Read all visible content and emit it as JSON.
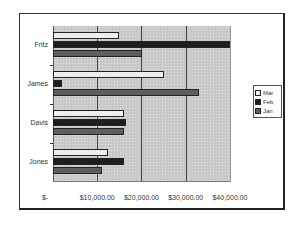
{
  "chart_data": {
    "type": "bar",
    "orientation": "horizontal",
    "title": "",
    "xlabel": "",
    "ylabel": "",
    "categories": [
      "Jones",
      "Davis",
      "James",
      "Fritz"
    ],
    "series": [
      {
        "name": "Jan",
        "values": [
          11000,
          16000,
          33000,
          20000
        ]
      },
      {
        "name": "Feb",
        "values": [
          16000,
          16500,
          2000,
          40000
        ]
      },
      {
        "name": "Mar",
        "values": [
          12500,
          16000,
          25000,
          15000
        ]
      }
    ],
    "xlim": [
      0,
      40000
    ],
    "x_ticks": [
      0,
      10000,
      20000,
      30000,
      40000
    ],
    "x_tick_labels": [
      "$-",
      "$10,000.00",
      "$20,000.00",
      "$30,000.00",
      "$40,000.00"
    ],
    "grid": {
      "vertical": true,
      "horizontal": false
    },
    "legend": {
      "position": "right",
      "entries": [
        "Mar",
        "Feb",
        "Jan"
      ]
    },
    "colors": {
      "Mar": "#eeeeee",
      "Feb": "#1e1e1e",
      "Jan": "#5e5e5e",
      "plot_background": "#c8c8c8"
    }
  },
  "labels": {
    "categories_top_to_bottom": [
      "Fritz",
      "James",
      "Davis",
      "Jones"
    ],
    "x_ticks": [
      "$-",
      "$10,000.00",
      "$20,000.00",
      "$30,000.00",
      "$40,000.00"
    ],
    "legend": [
      "Mar",
      "Feb",
      "Jan"
    ]
  }
}
